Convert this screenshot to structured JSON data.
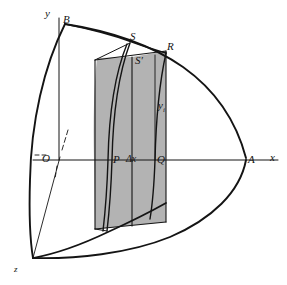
{
  "figure": {
    "type": "geometry-diagram",
    "background_color": "#ffffff",
    "stroke_color": "#141414",
    "shade_color": "#b0b0b0",
    "axes": [
      {
        "id": "x-axis",
        "label": "x",
        "x": 270,
        "y": 160
      },
      {
        "id": "y-axis",
        "label": "y",
        "x": 45,
        "y": 13
      },
      {
        "id": "z-axis",
        "label": "z",
        "x": 14,
        "y": 270
      }
    ],
    "points": [
      {
        "id": "point-B",
        "label": "B",
        "x": 63,
        "y": 19
      },
      {
        "id": "point-S",
        "label": "S",
        "x": 130,
        "y": 38
      },
      {
        "id": "point-R",
        "label": "R",
        "x": 166,
        "y": 48
      },
      {
        "id": "point-Sprime",
        "label": "S′",
        "x": 134,
        "y": 61
      },
      {
        "id": "point-O",
        "label": "O",
        "x": 43,
        "y": 159
      },
      {
        "id": "point-P",
        "label": "P",
        "x": 111,
        "y": 161
      },
      {
        "id": "point-Q",
        "label": "Q",
        "x": 155,
        "y": 161
      },
      {
        "id": "point-A",
        "label": "A",
        "x": 249,
        "y": 161
      }
    ],
    "measures": [
      {
        "id": "delta-x-label",
        "label": "Δx",
        "x": 126,
        "y": 161
      },
      {
        "id": "y-sub-i-label",
        "label": "y",
        "sub": "i",
        "x": 159,
        "y": 106
      }
    ]
  }
}
